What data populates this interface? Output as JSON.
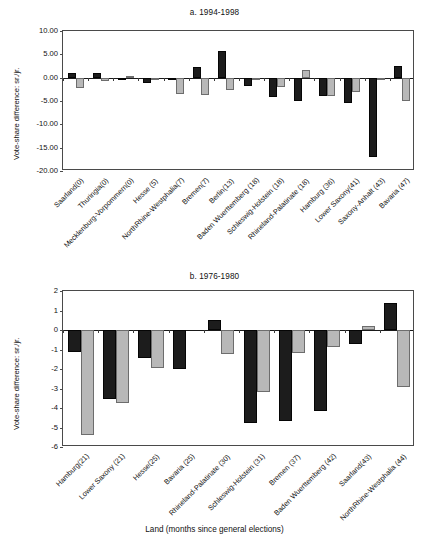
{
  "figure": {
    "xaxis_title": "Land (months since general elections)",
    "ylabel": "Vote-share difference: sr./jr."
  },
  "chart_data": [
    {
      "type": "bar",
      "title": "a. 1994-1998",
      "xlabel": "",
      "ylabel": "Vote-share difference: sr./jr.",
      "ylim": [
        -20,
        10
      ],
      "yticks": [
        "10.00",
        "5.00",
        "0.00",
        "-5.00",
        "-10.00",
        "-15.00",
        "-20.00"
      ],
      "ytick_values": [
        10,
        5,
        0,
        -5,
        -10,
        -15,
        -20
      ],
      "grid": false,
      "legend": "none",
      "categories": [
        "Saarland(0)",
        "Thuringia(0)",
        "Mecklenburg-Vorpommern(0)",
        "Hesse (5)",
        "NorthRhine-Westphalia(7)",
        "Bremen(7)",
        "Berlin(13)",
        "Baden Wuerttemberg (18)",
        "Schleswig-Holstein (18)",
        "Rhineland-Palatinate (18)",
        "Hamburg (36)",
        "Lower Saxony(41)",
        "Saxony-Anhalt (43)",
        "Bavaria (47)"
      ],
      "series": [
        {
          "name": "sr",
          "values": [
            1.0,
            1.1,
            -0.6,
            -1.2,
            -0.2,
            2.2,
            5.8,
            -1.8,
            -4.2,
            -5.0,
            -3.9,
            -5.4,
            -17.1,
            2.6
          ]
        },
        {
          "name": "jr",
          "values": [
            -2.2,
            -0.8,
            0.3,
            -0.5,
            -3.4,
            -3.8,
            -2.7,
            -0.5,
            -1.9,
            1.7,
            -4.0,
            -3.0,
            -0.1,
            -4.9
          ]
        }
      ]
    },
    {
      "type": "bar",
      "title": "b. 1976-1980",
      "xlabel": "Land (months since general elections)",
      "ylabel": "Vote-share difference: sr./jr.",
      "ylim": [
        -6,
        2
      ],
      "yticks": [
        "2",
        "1",
        "0",
        "-1",
        "-2",
        "-3",
        "-4",
        "-5",
        "-6"
      ],
      "ytick_values": [
        2,
        1,
        0,
        -1,
        -2,
        -3,
        -4,
        -5,
        -6
      ],
      "grid": false,
      "legend": "none",
      "categories": [
        "Hamburg(21)",
        "Lower Saxony (21)",
        "Hesse(25)",
        "Bavaria (25)",
        "Rhineland-Palatinate (30)",
        "Schleswig-Holstein (31)",
        "Bremen (37)",
        "Baden Wuerttemberg (42)",
        "Saarland(43)",
        "NorthRhine-Westphalia (44)"
      ],
      "series": [
        {
          "name": "sr",
          "values": [
            -1.15,
            -3.55,
            -1.45,
            -2.0,
            0.5,
            -4.75,
            -4.65,
            -4.15,
            -0.7,
            1.4
          ]
        },
        {
          "name": "jr",
          "values": [
            -5.4,
            -3.75,
            -1.95,
            0.0,
            -1.25,
            -3.2,
            -1.2,
            -0.85,
            0.2,
            -2.9
          ]
        }
      ]
    }
  ]
}
